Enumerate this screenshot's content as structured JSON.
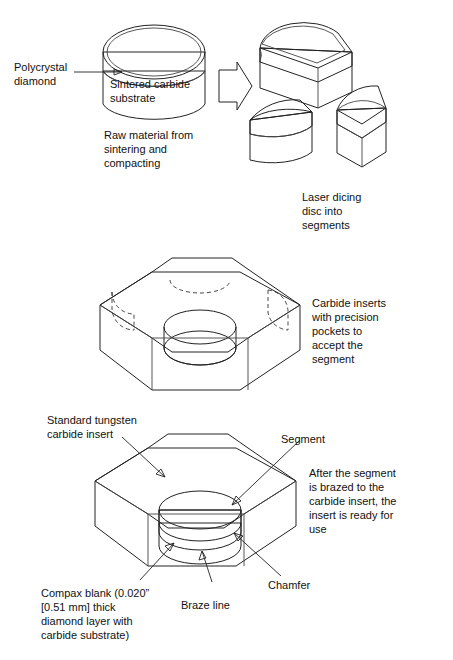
{
  "figure": {
    "colors": {
      "background": "#ffffff",
      "outline": "#222222",
      "face_light": "#d2d2d2",
      "face_mid": "#c6c6c6",
      "face_dark": "#b8b8b8",
      "pocket_dark": "#8e8e8e",
      "segment_dark": "#8b8b8b",
      "white_body": "#ffffff",
      "text": "#111111"
    }
  },
  "labels": {
    "polycrystal_diamond": "Polycrystal\ndiamond",
    "sintered_carbide_substrate": "Sintered carbide\nsubstrate",
    "raw_material": "Raw material from\nsintering and\ncompacting",
    "laser_dicing": "Laser dicing\ndisc into\nsegments",
    "carbide_inserts": "Carbide inserts\nwith precision\npockets to\naccept the\nsegment",
    "standard_tungsten": "Standard tungsten\ncarbide insert",
    "segment": "Segment",
    "chamfer": "Chamfer",
    "braze_line": "Braze line",
    "compax_blank": "Compax blank (0.020”\n[0.51 mm] thick\ndiamond layer with\ncarbide substrate)",
    "after_segment": "After the segment\nis brazed to the\ncarbide insert, the\ninsert is ready for\nuse"
  },
  "stages": [
    {
      "name": "raw-disc",
      "caption": "Raw material from sintering and compacting"
    },
    {
      "name": "laser-diced-segments",
      "caption": "Laser dicing disc into segments"
    },
    {
      "name": "carbide-insert-pocket",
      "caption": "Carbide inserts with precision pockets to accept the segment"
    },
    {
      "name": "brazed-insert",
      "caption": "After the segment is brazed to the carbide insert, the insert is ready for use"
    }
  ],
  "measurements": {
    "diamond_layer_thickness_in": "0.020”",
    "diamond_layer_thickness_mm": "0.51 mm"
  }
}
